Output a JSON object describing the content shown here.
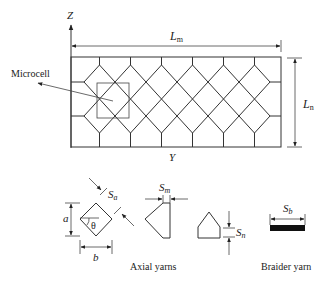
{
  "figure": {
    "axis_z_label": "Z",
    "axis_y_label": "Y",
    "length_m_label": "L",
    "length_m_sub": "m",
    "length_n_label": "L",
    "length_n_sub": "n",
    "microcell_label": "Microcell",
    "lattice": {
      "diamond_columns": 6,
      "diamond_rows": 2
    }
  },
  "details": {
    "a_label": "a",
    "b_label": "b",
    "theta_label": "θ",
    "sa_label": "S",
    "sa_sub": "a",
    "sm_label": "S",
    "sm_sub": "m",
    "sn_label": "S",
    "sn_sub": "n",
    "sb_label": "S",
    "sb_sub": "b",
    "axial_caption": "Axial yarns",
    "braider_caption": "Braider yarn"
  },
  "colors": {
    "line": "#333333",
    "bar": "#111111"
  }
}
